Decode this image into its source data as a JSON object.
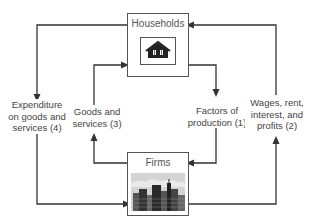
{
  "nodes": {
    "households": {
      "title": "Households",
      "icon": "house-icon"
    },
    "firms": {
      "title": "Firms",
      "icon": "city-skyline-icon"
    }
  },
  "flows": {
    "expenditure": {
      "label": "Expenditure\non goods and\nservices (4)"
    },
    "goods_services": {
      "label": "Goods and\nservices (3)"
    },
    "factors": {
      "label": "Factors of\nproduction (1)"
    },
    "wages": {
      "label": "Wages, rent,\ninterest, and\nprofits (2)"
    }
  },
  "colors": {
    "line": "#333333",
    "box_border": "#555555",
    "icon_dark": "#222222",
    "sky": "#cfcfcf"
  }
}
